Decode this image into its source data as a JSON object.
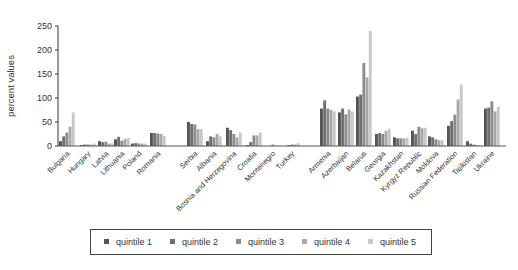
{
  "chart_data": {
    "type": "bar",
    "title": "",
    "xlabel": "",
    "ylabel": "percent values",
    "ylim": [
      0,
      250
    ],
    "yticks": [
      0,
      50,
      100,
      150,
      200,
      250
    ],
    "grid": false,
    "legend_position": "bottom",
    "categories": [
      "Bulgaria",
      "Hungary",
      "Latvia",
      "Lithuania",
      "Poland",
      "Romania",
      "Serbia",
      "Albania",
      "Bosnia and Herzegovina",
      "Croatia",
      "Montenegro",
      "Turkey",
      "Armenia",
      "Azerbaijan",
      "Belarus",
      "Georgia",
      "Kazakhstan",
      "Kyrgyz Republic",
      "Moldova",
      "Russian Federation",
      "Tajikistan",
      "Ukraine"
    ],
    "groups": [
      {
        "start": 0,
        "end": 5
      },
      {
        "start": 6,
        "end": 11
      },
      {
        "start": 12,
        "end": 21
      }
    ],
    "series": [
      {
        "name": "quintile 1",
        "color": "#555555",
        "values": [
          10,
          2,
          10,
          14,
          5,
          27,
          50,
          10,
          38,
          2,
          0,
          0,
          78,
          70,
          103,
          25,
          18,
          32,
          20,
          42,
          10,
          78
        ]
      },
      {
        "name": "quintile 2",
        "color": "#707070",
        "values": [
          20,
          3,
          8,
          19,
          6,
          27,
          46,
          20,
          33,
          8,
          0,
          2,
          95,
          78,
          107,
          27,
          16,
          25,
          18,
          52,
          5,
          80
        ]
      },
      {
        "name": "quintile 3",
        "color": "#8c8c8c",
        "values": [
          28,
          3,
          9,
          11,
          5,
          26,
          45,
          18,
          25,
          22,
          3,
          3,
          78,
          66,
          173,
          25,
          16,
          40,
          14,
          65,
          3,
          93
        ]
      },
      {
        "name": "quintile 4",
        "color": "#a8a8a8",
        "values": [
          40,
          3,
          5,
          15,
          5,
          25,
          35,
          25,
          18,
          22,
          0,
          3,
          75,
          76,
          143,
          32,
          16,
          37,
          12,
          97,
          2,
          72
        ]
      },
      {
        "name": "quintile 5",
        "color": "#c8c8c8",
        "values": [
          70,
          5,
          5,
          17,
          5,
          21,
          35,
          20,
          28,
          28,
          0,
          6,
          72,
          72,
          240,
          36,
          17,
          38,
          12,
          128,
          1,
          82
        ]
      }
    ]
  },
  "legend": {
    "items": [
      "quintile 1",
      "quintile 2",
      "quintile 3",
      "quintile 4",
      "quintile 5"
    ]
  }
}
